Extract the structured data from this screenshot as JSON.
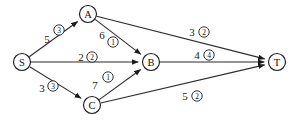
{
  "diagram": {
    "type": "flow-network",
    "nodes": [
      {
        "id": "S",
        "label": "S",
        "x": 22,
        "y": 62,
        "r": 8.5
      },
      {
        "id": "A",
        "label": "A",
        "x": 88,
        "y": 14,
        "r": 8.5
      },
      {
        "id": "B",
        "label": "B",
        "x": 151,
        "y": 62,
        "r": 8.5
      },
      {
        "id": "C",
        "label": "C",
        "x": 92,
        "y": 105,
        "r": 8.5
      },
      {
        "id": "T",
        "label": "T",
        "x": 277,
        "y": 62,
        "r": 8.5
      }
    ],
    "edges": [
      {
        "id": "edge-s-a",
        "from": "S",
        "to": "A",
        "capacity": "5",
        "flow": "3",
        "cap_x": 47,
        "cap_y": 39,
        "flow_x": 59,
        "flow_y": 30
      },
      {
        "id": "edge-s-b",
        "from": "S",
        "to": "B",
        "capacity": "2",
        "flow": "2",
        "cap_x": 81,
        "cap_y": 57,
        "flow_x": 92,
        "flow_y": 57
      },
      {
        "id": "edge-s-c",
        "from": "S",
        "to": "C",
        "capacity": "3",
        "flow": "3",
        "cap_x": 42,
        "cap_y": 88,
        "flow_x": 53,
        "flow_y": 86
      },
      {
        "id": "edge-a-b",
        "from": "A",
        "to": "B",
        "capacity": "6",
        "flow": "1",
        "cap_x": 102,
        "cap_y": 35,
        "flow_x": 113,
        "flow_y": 42
      },
      {
        "id": "edge-a-t",
        "from": "A",
        "to": "T",
        "capacity": "3",
        "flow": "2",
        "cap_x": 192,
        "cap_y": 32,
        "flow_x": 204,
        "flow_y": 32
      },
      {
        "id": "edge-c-b",
        "from": "C",
        "to": "B",
        "capacity": "7",
        "flow": "1",
        "cap_x": 95,
        "cap_y": 85,
        "flow_x": 108,
        "flow_y": 77
      },
      {
        "id": "edge-b-t",
        "from": "B",
        "to": "T",
        "capacity": "4",
        "flow": "4",
        "cap_x": 197,
        "cap_y": 55,
        "flow_x": 209,
        "flow_y": 55
      },
      {
        "id": "edge-c-t",
        "from": "C",
        "to": "T",
        "capacity": "5",
        "flow": "2",
        "cap_x": 185,
        "cap_y": 96,
        "flow_x": 197,
        "flow_y": 96
      }
    ]
  }
}
